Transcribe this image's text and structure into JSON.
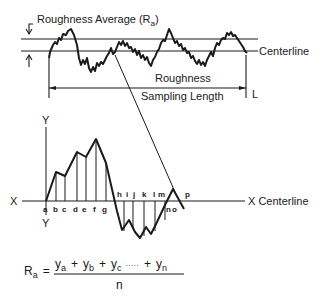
{
  "diagram": {
    "top": {
      "ra_label": "Roughness Average (R",
      "ra_sub": "a",
      "ra_close": ")",
      "centerline_label": "Centerline",
      "length_label_1": "Roughness",
      "length_label_2": "Sampling Length",
      "length_symbol": "L"
    },
    "bottom": {
      "y_top": "Y",
      "y_bottom": "Y",
      "x_left": "X",
      "x_right": "X Centerline",
      "ordinates_above": [
        "a",
        "b",
        "c",
        "d",
        "e",
        "f",
        "g"
      ],
      "ordinates_below": [
        "h",
        "i",
        "j",
        "k",
        "l",
        "m"
      ],
      "ordinates_end": [
        "n",
        "o",
        "p"
      ]
    },
    "formula": {
      "lhs": "R",
      "lhs_sub": "a",
      "equals": "=",
      "numerator_terms": [
        {
          "base": "y",
          "sub": "a"
        },
        {
          "base": "y",
          "sub": "b"
        },
        {
          "base": "y",
          "sub": "c"
        },
        {
          "base": "y",
          "sub": "n"
        }
      ],
      "plus": "+",
      "ellipsis": "·····",
      "denominator": "n"
    }
  }
}
